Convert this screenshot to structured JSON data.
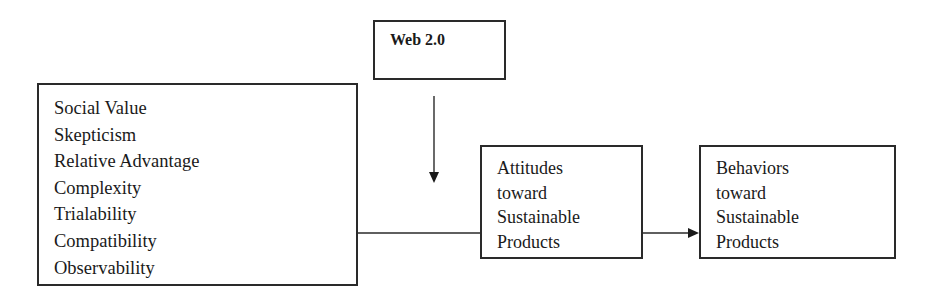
{
  "diagram": {
    "type": "conceptual-model",
    "factors_box": {
      "items": [
        "Social Value",
        "Skepticism",
        "Relative Advantage",
        "Complexity",
        "Trialability",
        "Compatibility",
        "Observability"
      ]
    },
    "moderator_box": {
      "label": "Web 2.0"
    },
    "attitudes_box": {
      "lines": [
        "Attitudes",
        "toward",
        "Sustainable",
        "Products"
      ]
    },
    "behaviors_box": {
      "lines": [
        "Behaviors",
        "toward",
        "Sustainable",
        "Products"
      ]
    },
    "edges": [
      {
        "from": "factors_box",
        "to": "attitudes_box",
        "style": "line"
      },
      {
        "from": "moderator_box",
        "to": "factors_to_attitudes_edge",
        "style": "arrow-down"
      },
      {
        "from": "attitudes_box",
        "to": "behaviors_box",
        "style": "arrow-right"
      }
    ],
    "colors": {
      "stroke": "#2a2a2a",
      "text": "#1a1a1a",
      "background": "#ffffff"
    }
  }
}
